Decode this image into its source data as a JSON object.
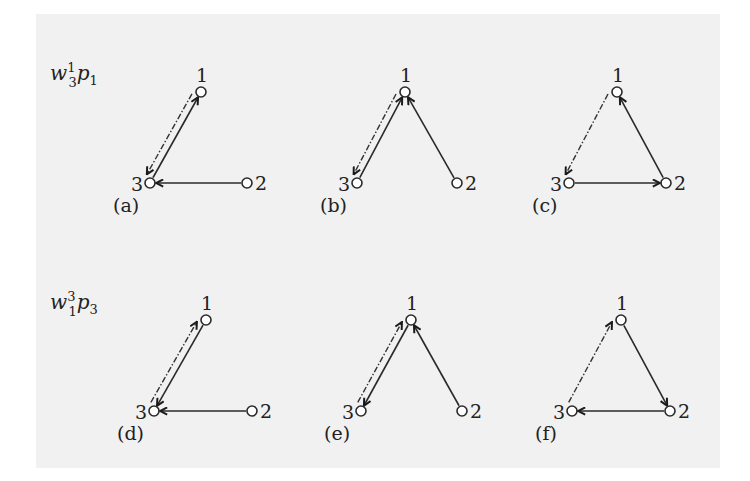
{
  "figure": {
    "background_color": "#f1f1f1",
    "row_labels": [
      {
        "base": "w",
        "sup": "1",
        "sub": "3",
        "base2": "p",
        "sub2": "1"
      },
      {
        "base": "w",
        "sup": "3",
        "sub": "1",
        "base2": "p",
        "sub2": "3"
      }
    ],
    "node_labels": [
      "1",
      "2",
      "3"
    ],
    "panels": [
      {
        "id": "a",
        "caption": "(a)",
        "nodes": {
          "1": [
            201,
            92
          ],
          "2": [
            247,
            183
          ],
          "3": [
            150,
            183
          ]
        },
        "solid_edges": [
          [
            "2",
            "3"
          ],
          [
            "3",
            "1"
          ]
        ],
        "dashed_edges": [
          [
            "1",
            "3"
          ]
        ]
      },
      {
        "id": "b",
        "caption": "(b)",
        "nodes": {
          "1": [
            405,
            92
          ],
          "2": [
            457,
            183
          ],
          "3": [
            357,
            183
          ]
        },
        "solid_edges": [
          [
            "3",
            "1"
          ],
          [
            "2",
            "1"
          ]
        ],
        "dashed_edges": [
          [
            "1",
            "3"
          ]
        ]
      },
      {
        "id": "c",
        "caption": "(c)",
        "nodes": {
          "1": [
            617,
            92
          ],
          "2": [
            666,
            183
          ],
          "3": [
            569,
            183
          ]
        },
        "solid_edges": [
          [
            "2",
            "1"
          ],
          [
            "3",
            "2"
          ]
        ],
        "dashed_edges": [
          [
            "1",
            "3"
          ]
        ]
      },
      {
        "id": "d",
        "caption": "(d)",
        "nodes": {
          "1": [
            206,
            320
          ],
          "2": [
            252,
            411
          ],
          "3": [
            154,
            411
          ]
        },
        "solid_edges": [
          [
            "1",
            "3"
          ],
          [
            "2",
            "3"
          ]
        ],
        "dashed_edges": [
          [
            "3",
            "1"
          ]
        ]
      },
      {
        "id": "e",
        "caption": "(e)",
        "nodes": {
          "1": [
            411,
            320
          ],
          "2": [
            462,
            411
          ],
          "3": [
            361,
            411
          ]
        },
        "solid_edges": [
          [
            "1",
            "3"
          ],
          [
            "2",
            "1"
          ]
        ],
        "dashed_edges": [
          [
            "3",
            "1"
          ]
        ]
      },
      {
        "id": "f",
        "caption": "(f)",
        "nodes": {
          "1": [
            621,
            320
          ],
          "2": [
            670,
            411
          ],
          "3": [
            572,
            411
          ]
        },
        "solid_edges": [
          [
            "1",
            "2"
          ],
          [
            "2",
            "3"
          ]
        ],
        "dashed_edges": [
          [
            "3",
            "1"
          ]
        ]
      }
    ]
  }
}
